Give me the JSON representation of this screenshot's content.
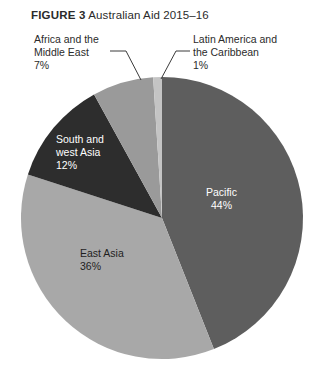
{
  "figure": {
    "number_label": "FIGURE 3",
    "title": "Australian Aid 2015–16"
  },
  "callouts": [
    {
      "id": "africa",
      "name": "Africa and the Middle East",
      "line1": "Africa and the",
      "line2": "Middle East",
      "value_label": "7%"
    },
    {
      "id": "latin-america",
      "name": "Latin America and the Caribbean",
      "line1": "Latin America and",
      "line2": "the Caribbean",
      "value_label": "1%"
    }
  ],
  "inner_labels": [
    {
      "id": "south-west-asia",
      "line1": "South and",
      "line2": "west Asia",
      "value_label": "12%"
    },
    {
      "id": "pacific",
      "line1": "Pacific",
      "value_label": "44%"
    },
    {
      "id": "east-asia",
      "line1": "East Asia",
      "value_label": "36%"
    }
  ],
  "colors": {
    "pacific": "#5e5e5e",
    "east_asia": "#a8a8a8",
    "south_west_asia": "#2d2d2d",
    "africa_middle_east": "#9a9a9a",
    "latin_america": "#c4c4c4",
    "background": "#ffffff",
    "text": "#2b2b2b",
    "leader_line": "#3a3a3a"
  },
  "chart_data": {
    "type": "pie",
    "title": "FIGURE 3 Australian Aid 2015–16",
    "unit": "percent",
    "total": 100,
    "start_angle_deg": 0,
    "direction": "clockwise",
    "legend": "none",
    "labels": [
      "Pacific",
      "East Asia",
      "South and west Asia",
      "Africa and the Middle East",
      "Latin America and the Caribbean"
    ],
    "values": [
      44,
      36,
      12,
      7,
      1
    ],
    "value_labels": [
      "44%",
      "36%",
      "12%",
      "7%",
      "1%"
    ],
    "slice_colors": [
      "#5e5e5e",
      "#a8a8a8",
      "#2d2d2d",
      "#9a9a9a",
      "#c4c4c4"
    ],
    "label_placement": [
      "inside",
      "inside",
      "inside",
      "outside-leader",
      "outside-leader"
    ],
    "geometry": {
      "center_x": 162,
      "center_y": 218,
      "radius": 141
    }
  }
}
